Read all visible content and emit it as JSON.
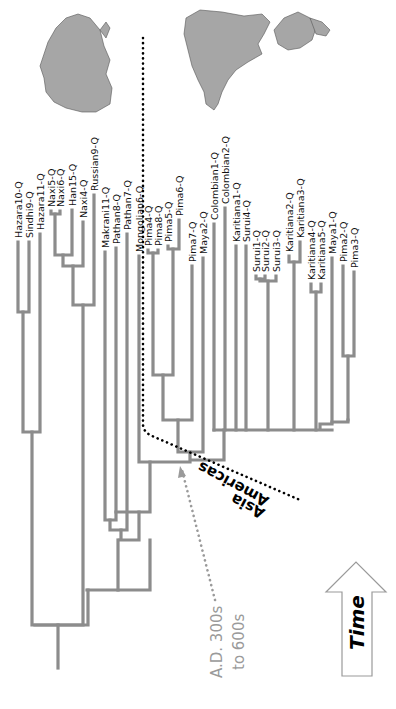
{
  "figure": {
    "orientation": "rotated 90 degrees (read with page turned clockwise)",
    "branch_color": "#8c8c8c",
    "divider_color": "#000000",
    "date_color": "#9a9a9a"
  },
  "leaves": [
    {
      "label": "Hazara10-Q",
      "x": 18,
      "top": 240
    },
    {
      "label": "Sindhi9-Q",
      "x": 29,
      "top": 240
    },
    {
      "label": "Hazara11-Q",
      "x": 40,
      "top": 232
    },
    {
      "label": "Naxi5-Q",
      "x": 51,
      "top": 209
    },
    {
      "label": "Naxi6-Q",
      "x": 60,
      "top": 209
    },
    {
      "label": "Han15-Q",
      "x": 72,
      "top": 208
    },
    {
      "label": "Naxi4-Q",
      "x": 83,
      "top": 220
    },
    {
      "label": "Russian9-Q",
      "x": 94,
      "top": 193
    },
    {
      "label": "Makrani11-Q",
      "x": 105,
      "top": 250
    },
    {
      "label": "Pathan8-Q",
      "x": 116,
      "top": 246
    },
    {
      "label": "Pathan7-Q",
      "x": 127,
      "top": 232
    },
    {
      "label": "Mongolian6-Q",
      "x": 139,
      "top": 254
    },
    {
      "label": "Pima4-Q",
      "x": 148,
      "top": 248
    },
    {
      "label": "Pima8-Q",
      "x": 158,
      "top": 248
    },
    {
      "label": "Pima5-Q",
      "x": 168,
      "top": 244
    },
    {
      "label": "Pima6-Q",
      "x": 179,
      "top": 218
    },
    {
      "label": "Pima7-Q",
      "x": 192,
      "top": 264
    },
    {
      "label": "Maya2-Q",
      "x": 203,
      "top": 256
    },
    {
      "label": "Colombian1-Q",
      "x": 214,
      "top": 222
    },
    {
      "label": "Colombian2-Q",
      "x": 225,
      "top": 206
    },
    {
      "label": "Karitiana1-Q",
      "x": 236,
      "top": 244
    },
    {
      "label": "Surui4-Q",
      "x": 246,
      "top": 244
    },
    {
      "label": "Surui1-Q",
      "x": 256,
      "top": 274
    },
    {
      "label": "Surui2-Q",
      "x": 265,
      "top": 274
    },
    {
      "label": "Surui3-Q",
      "x": 276,
      "top": 274
    },
    {
      "label": "Karitiana2-Q",
      "x": 289,
      "top": 254
    },
    {
      "label": "Karitiana3-Q",
      "x": 300,
      "top": 240
    },
    {
      "label": "Karitiana4-Q",
      "x": 311,
      "top": 282
    },
    {
      "label": "Karitiana5-Q",
      "x": 321,
      "top": 282
    },
    {
      "label": "Maya1-Q",
      "x": 332,
      "top": 256
    },
    {
      "label": "Pima2-Q",
      "x": 343,
      "top": 264
    },
    {
      "label": "Pima3-Q",
      "x": 354,
      "top": 270
    }
  ],
  "annotations": {
    "asia_label": "Asia",
    "americas_label": "Americas",
    "date_line1": "A.D. 300s",
    "date_line2": "to 600s",
    "time_label": "Time"
  },
  "maps": [
    {
      "name": "asia-map",
      "region": "Asia"
    },
    {
      "name": "americas-map",
      "region": "Americas"
    }
  ]
}
